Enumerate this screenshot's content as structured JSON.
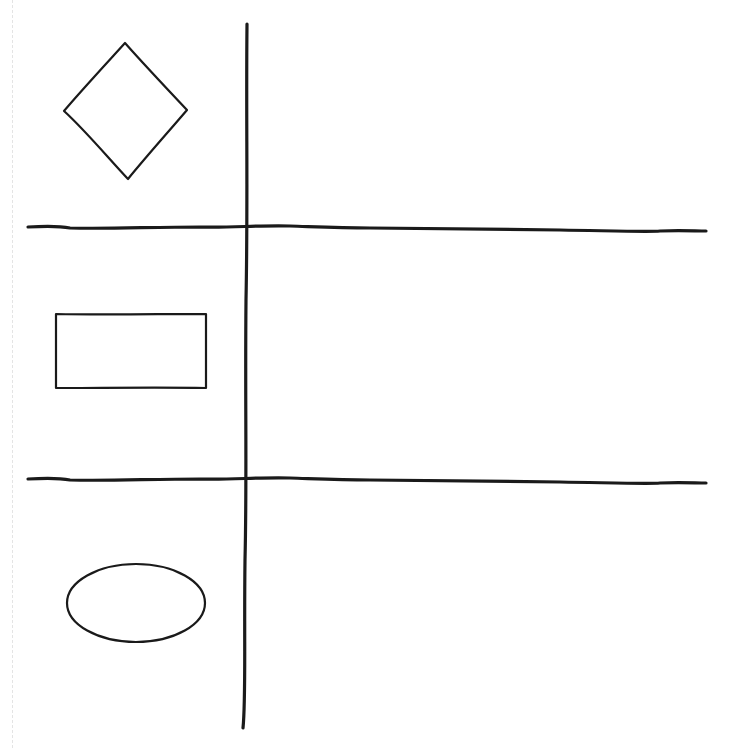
{
  "diagram": {
    "type": "hand-drawn shape table sketch",
    "background": "#ffffff",
    "stroke_color": "#1a1a1a",
    "grid": {
      "columns": 2,
      "rows": 3,
      "vertical_divider": {
        "x": 244,
        "y_top": 24,
        "y_bottom": 728
      },
      "horizontal_dividers": [
        {
          "y": 227,
          "x_left": 28,
          "x_right": 706
        },
        {
          "y": 480,
          "x_left": 28,
          "x_right": 706
        }
      ]
    },
    "rows": [
      {
        "shape": "diamond",
        "label": "",
        "cx": 125,
        "cy": 110
      },
      {
        "shape": "rectangle",
        "label": "",
        "x": 55,
        "y": 314,
        "w": 151,
        "h": 75
      },
      {
        "shape": "ellipse",
        "label": "",
        "cx": 136,
        "cy": 603,
        "rx": 69,
        "ry": 39
      }
    ]
  }
}
